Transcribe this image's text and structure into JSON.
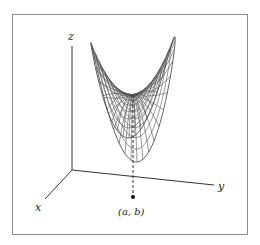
{
  "figure": {
    "axes": {
      "x_label": "x",
      "y_label": "y",
      "z_label": "z"
    },
    "point_label": "(a, b)",
    "colors": {
      "frame": "#8c8c8c",
      "axes": "#333333",
      "mesh": "#555555",
      "background": "#ffffff"
    }
  }
}
